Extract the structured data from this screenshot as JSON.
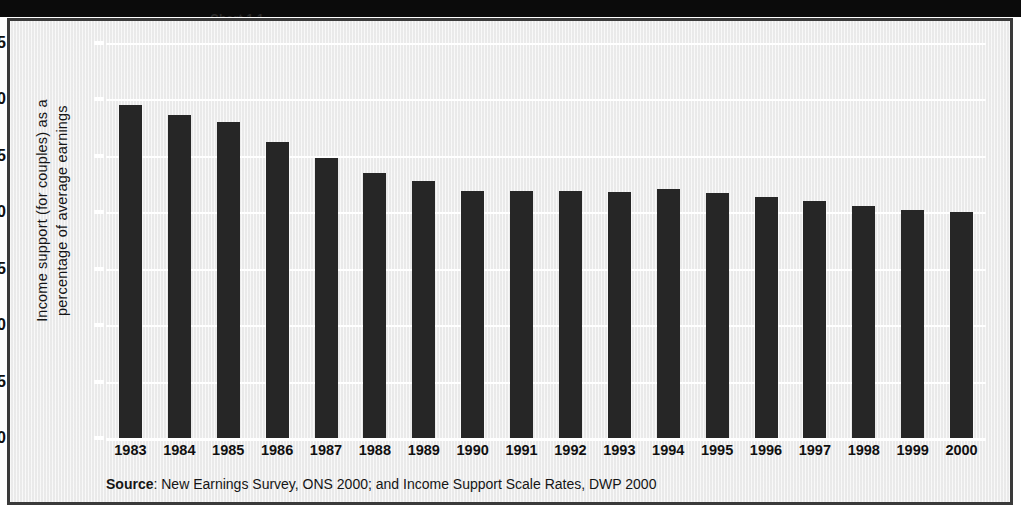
{
  "header": {
    "title_strip_text": "Chart 1.1"
  },
  "source": {
    "lead": "Source",
    "text": ": New Earnings Survey, ONS  2000; and Income Support Scale Rates, DWP 2000"
  },
  "chart_data": {
    "type": "bar",
    "title": "",
    "xlabel": "",
    "ylabel": "Income support (for couples) as a\npercentage of average earnings",
    "ylim": [
      0,
      35
    ],
    "yticks": [
      0,
      5,
      10,
      15,
      20,
      25,
      30,
      35
    ],
    "grid": true,
    "legend": "none",
    "bar_color": "#262626",
    "gridline_color": "#ffffff",
    "plot_background": "#f1f1f1",
    "categories": [
      "1983",
      "1984",
      "1985",
      "1986",
      "1987",
      "1988",
      "1989",
      "1990",
      "1991",
      "1992",
      "1993",
      "1994",
      "1995",
      "1996",
      "1997",
      "1998",
      "1999",
      "2000"
    ],
    "values": [
      29.5,
      28.6,
      28.0,
      26.2,
      24.8,
      23.5,
      22.8,
      21.9,
      21.9,
      21.9,
      21.8,
      22.1,
      21.7,
      21.4,
      21.0,
      20.6,
      20.2,
      20.0
    ]
  }
}
